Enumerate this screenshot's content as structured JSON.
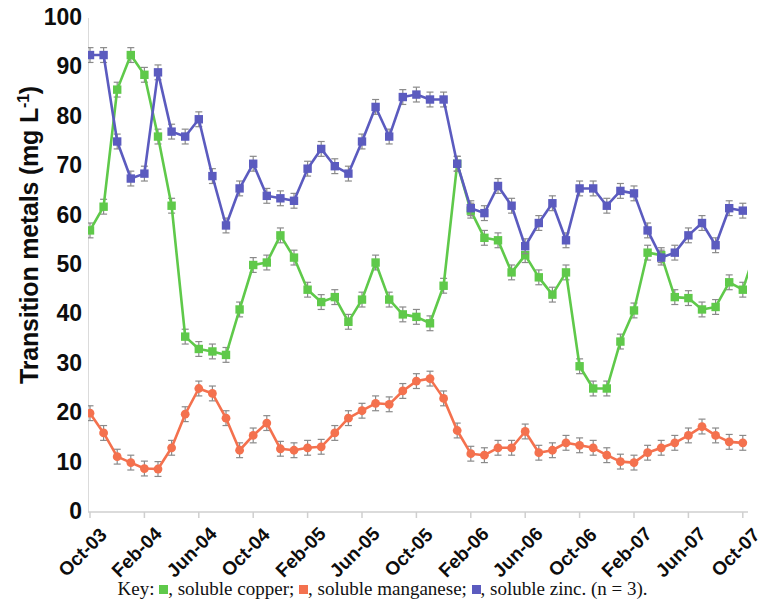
{
  "chart_data": {
    "type": "line",
    "title": "",
    "xlabel": "",
    "ylabel": "Transition metals (mg L-1)",
    "ylabel_html": "Transition metals (mg L<sup>-1</sup>)",
    "ylim": [
      0,
      100
    ],
    "ytick_values": [
      0,
      10,
      20,
      30,
      40,
      50,
      60,
      70,
      80,
      90,
      100
    ],
    "ytick_labels": [
      "0",
      "10",
      "20",
      "30",
      "40",
      "50",
      "60",
      "70",
      "80",
      "90",
      "100"
    ],
    "xtick_labels": [
      "Oct-03",
      "Feb-04",
      "Jun-04",
      "Oct-04",
      "Feb-05",
      "Jun-05",
      "Oct-05",
      "Feb-06",
      "Jun-06",
      "Oct-06",
      "Feb-07",
      "Jun-07",
      "Oct-07"
    ],
    "xtick_indices": [
      0,
      4,
      8,
      12,
      16,
      20,
      24,
      28,
      32,
      36,
      40,
      44,
      48
    ],
    "x_count": 49,
    "x_start": "Oct-03",
    "x_end": "Oct-07",
    "grid": false,
    "legend_position": "below",
    "error_bars": true,
    "error_bar_value": 1.5,
    "series": [
      {
        "name": "soluble copper",
        "color": "#5FC94A",
        "marker": "square",
        "values": [
          57.0,
          61.8,
          85.5,
          92.5,
          88.5,
          76.0,
          62.0,
          35.5,
          33.0,
          32.5,
          31.8,
          41.0,
          50.0,
          50.5,
          56.0,
          51.5,
          45.0,
          42.5,
          43.5,
          38.5,
          43.0,
          50.5,
          43.0,
          40.0,
          39.5,
          38.2,
          45.8,
          70.5,
          61.0,
          55.5,
          55.0,
          48.5,
          52.0,
          47.5,
          44.0,
          48.5,
          29.5,
          25.0,
          25.0,
          34.5,
          40.8,
          52.5,
          52.0,
          43.5,
          43.3,
          41.0,
          41.5,
          46.5,
          45.0,
          53.5,
          50.5
        ]
      },
      {
        "name": "soluble manganese",
        "color": "#F4714E",
        "marker": "circle",
        "values": [
          20.0,
          16.0,
          11.2,
          10.0,
          8.8,
          8.7,
          13.0,
          19.8,
          25.0,
          24.0,
          19.0,
          12.5,
          15.5,
          18.0,
          12.8,
          12.5,
          13.0,
          13.2,
          16.0,
          19.0,
          20.5,
          22.0,
          21.8,
          24.5,
          26.5,
          27.0,
          23.0,
          16.5,
          11.8,
          11.5,
          13.0,
          13.0,
          16.3,
          12.0,
          12.5,
          14.0,
          13.5,
          13.0,
          11.5,
          10.2,
          10.0,
          12.0,
          13.0,
          14.0,
          15.5,
          17.3,
          15.5,
          14.2,
          14.0
        ]
      },
      {
        "name": "soluble zinc",
        "color": "#5B5BBF",
        "marker": "square",
        "values": [
          92.5,
          92.5,
          75.0,
          67.5,
          68.5,
          89.0,
          77.0,
          76.0,
          79.5,
          68.0,
          58.0,
          65.5,
          70.5,
          64.0,
          63.5,
          63.0,
          69.5,
          73.5,
          70.0,
          68.5,
          75.0,
          82.0,
          76.0,
          84.0,
          84.5,
          83.5,
          83.5,
          70.5,
          61.5,
          60.5,
          66.0,
          62.0,
          53.8,
          58.5,
          62.5,
          55.0,
          65.5,
          65.5,
          62.0,
          65.0,
          64.5,
          57.0,
          51.5,
          52.5,
          56.0,
          58.5,
          54.0,
          61.5,
          61.0
        ]
      }
    ]
  },
  "legend": {
    "prefix": "Key:",
    "entries": [
      {
        "label": ", soluble copper;",
        "color": "#5FC94A"
      },
      {
        "label": ", soluble manganese;",
        "color": "#F4714E"
      },
      {
        "label": ", soluble zinc. (n = 3).",
        "color": "#5B5BBF"
      }
    ]
  },
  "axis": {
    "axis_color": "#cfcfcf"
  }
}
